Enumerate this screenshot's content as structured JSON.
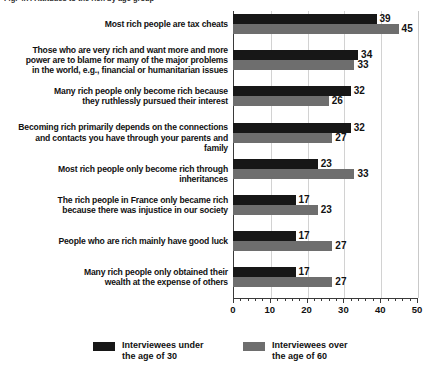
{
  "title_remnant": "Fig. 4.7: Attitudes to the rich by age group",
  "chart_data": {
    "type": "bar",
    "orientation": "horizontal",
    "title": "",
    "xlabel": "",
    "ylabel": "",
    "xlim": [
      0,
      50
    ],
    "xticks": [
      0,
      10,
      20,
      30,
      40,
      50
    ],
    "xtick_labels": [
      "0",
      "10",
      "20",
      "30",
      "40",
      "50"
    ],
    "minor_tick_step": 2,
    "grid": "vertical",
    "legend_position": "bottom",
    "categories": [
      "Most rich people are tax cheats",
      "Those who are very rich and want more and more\npower are to blame for many of the major problems\nin the world, e.g., financial or humanitarian issues",
      "Many rich people only become rich because\nthey ruthlessly pursued their interest",
      "Becoming rich primarily depends on the connections\nand contacts you have through your parents and family",
      "Most rich people only become rich through inheritances",
      "The rich people in France only became rich\nbecause there was injustice in our society",
      "People who are rich mainly have good luck",
      "Many rich people only obtained their\nwealth at the expense of others"
    ],
    "series": [
      {
        "name": "Interviewees under\nthe age of 30",
        "color": "#171717",
        "values": [
          39,
          34,
          32,
          32,
          23,
          17,
          17,
          17
        ]
      },
      {
        "name": "Interviewees over\nthe age of 60",
        "color": "#6e6e6e",
        "values": [
          45,
          33,
          26,
          27,
          33,
          23,
          27,
          27
        ]
      }
    ]
  },
  "legend": {
    "items": [
      {
        "label": "Interviewees under\nthe age of 30",
        "color": "#171717"
      },
      {
        "label": "Interviewees over\nthe age of 60",
        "color": "#6e6e6e"
      }
    ]
  }
}
